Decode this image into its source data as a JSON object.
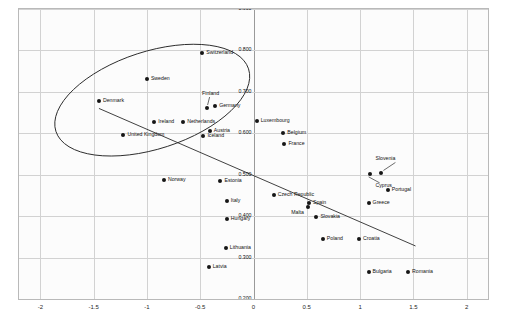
{
  "chart_data": {
    "type": "scatter",
    "title": "",
    "xlabel": "",
    "ylabel": "",
    "xlim": [
      -2.2,
      2.2
    ],
    "ylim": [
      0.2,
      0.9
    ],
    "grid": true,
    "legend": "none",
    "xticks": [
      "-2",
      "-1.5",
      "-1",
      "-0.5",
      "0",
      "0.5",
      "1",
      "1.5",
      "2"
    ],
    "xtick_values": [
      -2,
      -1.5,
      -1,
      -0.5,
      0,
      0.5,
      1,
      1.5,
      2
    ],
    "yticks": [
      "0.900",
      "0.800",
      "0.700",
      "0.600",
      "0.500",
      "0.400",
      "0.300",
      "0.200"
    ],
    "ytick_values": [
      0.9,
      0.8,
      0.7,
      0.6,
      0.5,
      0.4,
      0.3,
      0.2
    ],
    "point_color": "#161616",
    "line_color": "#2b2b2b",
    "ellipse_color": "#2b2b2b",
    "points": [
      {
        "label": "Switzerland",
        "x": -0.48,
        "y": 0.795,
        "side": "right"
      },
      {
        "label": "Sweden",
        "x": -1.0,
        "y": 0.731,
        "side": "right"
      },
      {
        "label": "Denmark",
        "x": -1.45,
        "y": 0.678,
        "side": "right"
      },
      {
        "label": "Finland",
        "x": -0.44,
        "y": 0.661,
        "side": "leader"
      },
      {
        "label": "Germany",
        "x": -0.36,
        "y": 0.665,
        "side": "right"
      },
      {
        "label": "Luxembourg",
        "x": 0.03,
        "y": 0.63,
        "side": "right"
      },
      {
        "label": "Ireland",
        "x": -0.93,
        "y": 0.627,
        "side": "right"
      },
      {
        "label": "Netherlands",
        "x": -0.66,
        "y": 0.628,
        "side": "right"
      },
      {
        "label": "Belgium",
        "x": 0.28,
        "y": 0.6,
        "side": "right"
      },
      {
        "label": "Austria",
        "x": -0.41,
        "y": 0.605,
        "side": "right"
      },
      {
        "label": "United Kingdom",
        "x": -1.22,
        "y": 0.596,
        "side": "right"
      },
      {
        "label": "Iceland",
        "x": -0.47,
        "y": 0.593,
        "side": "right"
      },
      {
        "label": "France",
        "x": 0.29,
        "y": 0.573,
        "side": "right"
      },
      {
        "label": "Slovenia",
        "x": 1.2,
        "y": 0.503,
        "side": "leader"
      },
      {
        "label": "Cyprus",
        "x": 1.09,
        "y": 0.502,
        "side": "leader"
      },
      {
        "label": "Norway",
        "x": -0.84,
        "y": 0.488,
        "side": "right"
      },
      {
        "label": "Estonia",
        "x": -0.31,
        "y": 0.486,
        "side": "right"
      },
      {
        "label": "Portugal",
        "x": 1.26,
        "y": 0.462,
        "side": "right"
      },
      {
        "label": "Czech Republic",
        "x": 0.19,
        "y": 0.451,
        "side": "right"
      },
      {
        "label": "Italy",
        "x": -0.25,
        "y": 0.436,
        "side": "right"
      },
      {
        "label": "Greece",
        "x": 1.08,
        "y": 0.431,
        "side": "right"
      },
      {
        "label": "Spain",
        "x": 0.52,
        "y": 0.431,
        "side": "right"
      },
      {
        "label": "Malta",
        "x": 0.51,
        "y": 0.423,
        "side": "left"
      },
      {
        "label": "Hungary",
        "x": -0.25,
        "y": 0.394,
        "side": "right"
      },
      {
        "label": "Slovakia",
        "x": 0.59,
        "y": 0.398,
        "side": "right"
      },
      {
        "label": "Poland",
        "x": 0.65,
        "y": 0.344,
        "side": "right"
      },
      {
        "label": "Croatia",
        "x": 0.99,
        "y": 0.344,
        "side": "right"
      },
      {
        "label": "Lithuania",
        "x": -0.26,
        "y": 0.324,
        "side": "right"
      },
      {
        "label": "Latvia",
        "x": -0.42,
        "y": 0.277,
        "side": "right"
      },
      {
        "label": "Bulgaria",
        "x": 1.08,
        "y": 0.265,
        "side": "right"
      },
      {
        "label": "Romania",
        "x": 1.45,
        "y": 0.265,
        "side": "right"
      }
    ],
    "trend_line": {
      "description": "downward sloping fitted regression line",
      "x_start": -1.45,
      "y_start": 0.66,
      "x_end": 1.52,
      "y_end": 0.328
    },
    "ellipse": {
      "description": "hand-drawn ellipse enclosing the north-western European cluster",
      "center_x": -0.95,
      "center_y": 0.68,
      "width": 1.9,
      "height": 0.235,
      "rotation_deg": -18
    }
  }
}
